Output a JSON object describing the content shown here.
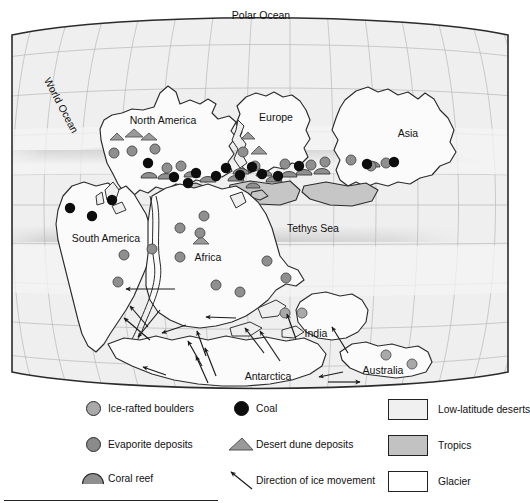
{
  "figure": {
    "type": "paleogeographic-map",
    "projection": "oval (Mollweide-like) world map with latitude/longitude graticule"
  },
  "map_labels": {
    "polar_ocean": "Polar Ocean",
    "world_ocean": "World Ocean",
    "north_america": "North America",
    "europe": "Europe",
    "asia": "Asia",
    "south_america": "South America",
    "africa": "Africa",
    "tethys_sea": "Tethys Sea",
    "india": "India",
    "australia": "Australia",
    "antarctica": "Antarctica"
  },
  "legend": {
    "columns": [
      {
        "id": "column-1",
        "items": [
          {
            "id": "ice-rafted-boulders",
            "label": "Ice-rafted boulders",
            "symbol": "circle-light-gray",
            "color": "#a8a8a8"
          },
          {
            "id": "evaporite-deposits",
            "label": "Evaporite deposits",
            "symbol": "circle-mid-gray",
            "color": "#8a8a8a"
          },
          {
            "id": "coral-reef",
            "label": "Coral reef",
            "symbol": "half-ellipse-gray",
            "color": "#8f8f8f"
          }
        ]
      },
      {
        "id": "column-2",
        "items": [
          {
            "id": "coal",
            "label": "Coal",
            "symbol": "circle-black",
            "color": "#0d0d0d"
          },
          {
            "id": "desert-dune-deposits",
            "label": "Desert dune deposits",
            "symbol": "triangle-gray",
            "color": "#9a9a9a"
          },
          {
            "id": "direction-of-ice-movement",
            "label": "Direction of ice movement",
            "symbol": "arrow",
            "color": "#1a1a1a"
          }
        ]
      },
      {
        "id": "column-3",
        "items": [
          {
            "id": "low-latitude-deserts",
            "label": "Low-latitude deserts",
            "symbol": "swatch",
            "color": "#f0f0f0"
          },
          {
            "id": "tropics",
            "label": "Tropics",
            "symbol": "swatch",
            "color": "#c2c2c2"
          },
          {
            "id": "glacier",
            "label": "Glacier",
            "symbol": "swatch",
            "color": "#ffffff"
          }
        ]
      }
    ]
  },
  "palette": {
    "ocean_fill": "#efefef",
    "land_fill": "#fbfbfb",
    "tropics_band": "#c2c2c2",
    "low_latitude_desert": "#f0f0f0",
    "graticule": "#b4b4b4",
    "outline": "#2b2b2b",
    "coal": "#0d0d0d",
    "evaporite": "#8a8a8a",
    "ice_rafted": "#a8a8a8",
    "dune": "#9a9a9a",
    "reef": "#8f8f8f"
  },
  "symbol_counts": {
    "coal": 16,
    "evaporite_deposits": 27,
    "ice_rafted_boulders": 6,
    "coral_reef": 13,
    "desert_dune_deposits": 6,
    "ice_movement_arrows": 17
  },
  "markers": {
    "coal": [
      [
        148,
        152
      ],
      [
        175,
        166
      ],
      [
        196,
        158
      ],
      [
        217,
        166
      ],
      [
        222,
        171
      ],
      [
        183,
        180
      ],
      [
        214,
        169
      ],
      [
        251,
        169
      ],
      [
        259,
        173
      ],
      [
        243,
        167
      ],
      [
        277,
        170
      ],
      [
        300,
        162
      ],
      [
        367,
        163
      ],
      [
        394,
        161
      ],
      [
        70,
        208
      ],
      [
        92,
        215
      ]
    ],
    "evaporite": [
      [
        114,
        153
      ],
      [
        131,
        151
      ],
      [
        155,
        149
      ],
      [
        166,
        168
      ],
      [
        179,
        166
      ],
      [
        243,
        152
      ],
      [
        255,
        166
      ],
      [
        285,
        164
      ],
      [
        311,
        165
      ],
      [
        313,
        160
      ],
      [
        350,
        160
      ],
      [
        371,
        166
      ],
      [
        386,
        163
      ],
      [
        204,
        216
      ],
      [
        180,
        227
      ],
      [
        200,
        232
      ],
      [
        179,
        256
      ],
      [
        267,
        260
      ],
      [
        215,
        284
      ],
      [
        285,
        277
      ],
      [
        239,
        291
      ],
      [
        297,
        288
      ],
      [
        285,
        313
      ],
      [
        297,
        313
      ],
      [
        386,
        355
      ],
      [
        412,
        363
      ],
      [
        118,
        281
      ]
    ],
    "ice_rafted": [
      [
        118,
        281
      ],
      [
        122,
        254
      ],
      [
        145,
        250
      ],
      [
        386,
        355
      ],
      [
        412,
        363
      ],
      [
        297,
        313
      ]
    ],
    "coral_reef": [
      [
        148,
        175
      ],
      [
        165,
        176
      ],
      [
        191,
        174
      ],
      [
        200,
        179
      ],
      [
        193,
        170
      ],
      [
        240,
        171
      ],
      [
        235,
        176
      ],
      [
        264,
        173
      ],
      [
        273,
        179
      ],
      [
        288,
        174
      ],
      [
        300,
        172
      ],
      [
        322,
        171
      ],
      [
        372,
        164
      ]
    ],
    "desert_dune": [
      [
        117,
        137
      ],
      [
        133,
        133
      ],
      [
        148,
        136
      ],
      [
        248,
        135
      ],
      [
        258,
        150
      ],
      [
        200,
        240
      ]
    ]
  },
  "ice_arrows": [
    {
      "from": [
        175,
        289
      ],
      "to": [
        124,
        289
      ]
    },
    {
      "from": [
        145,
        325
      ],
      "to": [
        128,
        305
      ]
    },
    {
      "from": [
        147,
        338
      ],
      "to": [
        123,
        318
      ]
    },
    {
      "from": [
        161,
        312
      ],
      "to": [
        136,
        336
      ]
    },
    {
      "from": [
        183,
        325
      ],
      "to": [
        160,
        332
      ]
    },
    {
      "from": [
        234,
        318
      ],
      "to": [
        205,
        317
      ]
    },
    {
      "from": [
        200,
        366
      ],
      "to": [
        186,
        341
      ]
    },
    {
      "from": [
        204,
        355
      ],
      "to": [
        195,
        330
      ]
    },
    {
      "from": [
        205,
        382
      ],
      "to": [
        193,
        355
      ]
    },
    {
      "from": [
        213,
        375
      ],
      "to": [
        202,
        347
      ]
    },
    {
      "from": [
        262,
        352
      ],
      "to": [
        243,
        327
      ]
    },
    {
      "from": [
        277,
        360
      ],
      "to": [
        257,
        330
      ]
    },
    {
      "from": [
        294,
        338
      ],
      "to": [
        285,
        313
      ]
    },
    {
      "from": [
        163,
        374
      ],
      "to": [
        142,
        366
      ]
    },
    {
      "from": [
        345,
        352
      ],
      "to": [
        330,
        326
      ]
    },
    {
      "from": [
        340,
        371
      ],
      "to": [
        318,
        376
      ]
    },
    {
      "from": [
        327,
        380
      ],
      "to": [
        358,
        380
      ]
    }
  ]
}
